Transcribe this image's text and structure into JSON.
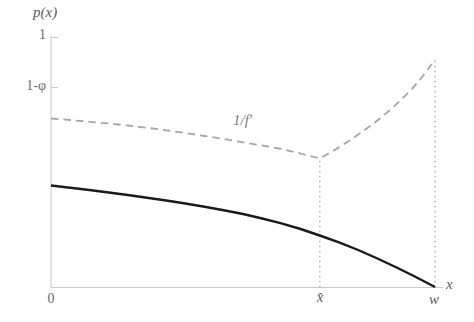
{
  "chart_data": {
    "type": "line",
    "title": "",
    "xlabel": "x",
    "ylabel": "p(x)",
    "ylim": [
      0,
      1
    ],
    "x_domain_note": "x runs from 0 to w; x-hat is approximately 0.70·w",
    "grid": false,
    "axis_color": "#c9c9c9",
    "guide_color": "#b3b3b3",
    "x_ticks": [
      {
        "pos": 0.0,
        "label": "0"
      },
      {
        "pos": 0.7,
        "label": "x̂"
      },
      {
        "pos": 1.0,
        "label": "w"
      }
    ],
    "y_ticks": [
      {
        "pos": 1.0,
        "label": "1"
      },
      {
        "pos": 0.8,
        "label": "1-φ"
      }
    ],
    "series": [
      {
        "name": "1/f′",
        "style": "dashed",
        "color": "#a6a6a6",
        "width": 1.8,
        "dash": "7.5 5",
        "points": [
          [
            0.0,
            0.676
          ],
          [
            0.05,
            0.67
          ],
          [
            0.1,
            0.663
          ],
          [
            0.15,
            0.656
          ],
          [
            0.2,
            0.648
          ],
          [
            0.25,
            0.639
          ],
          [
            0.3,
            0.629
          ],
          [
            0.35,
            0.618
          ],
          [
            0.4,
            0.606
          ],
          [
            0.45,
            0.594
          ],
          [
            0.5,
            0.581
          ],
          [
            0.55,
            0.568
          ],
          [
            0.6,
            0.554
          ],
          [
            0.65,
            0.536
          ],
          [
            0.7,
            0.516
          ],
          [
            0.73,
            0.542
          ],
          [
            0.76,
            0.57
          ],
          [
            0.79,
            0.601
          ],
          [
            0.82,
            0.634
          ],
          [
            0.85,
            0.668
          ],
          [
            0.88,
            0.706
          ],
          [
            0.91,
            0.748
          ],
          [
            0.94,
            0.795
          ],
          [
            0.96,
            0.83
          ],
          [
            0.98,
            0.869
          ],
          [
            1.0,
            0.912
          ]
        ]
      },
      {
        "name": "p(x)",
        "style": "solid",
        "color": "#1a1a1a",
        "width": 2.4,
        "dash": "",
        "points": [
          [
            0.0,
            0.408
          ],
          [
            0.05,
            0.399
          ],
          [
            0.1,
            0.39
          ],
          [
            0.15,
            0.38
          ],
          [
            0.2,
            0.37
          ],
          [
            0.25,
            0.359
          ],
          [
            0.3,
            0.348
          ],
          [
            0.35,
            0.336
          ],
          [
            0.4,
            0.323
          ],
          [
            0.45,
            0.309
          ],
          [
            0.5,
            0.294
          ],
          [
            0.55,
            0.276
          ],
          [
            0.6,
            0.257
          ],
          [
            0.65,
            0.234
          ],
          [
            0.7,
            0.208
          ],
          [
            0.75,
            0.181
          ],
          [
            0.8,
            0.15
          ],
          [
            0.85,
            0.116
          ],
          [
            0.9,
            0.08
          ],
          [
            0.95,
            0.042
          ],
          [
            1.0,
            0.002
          ]
        ]
      }
    ],
    "guides": [
      {
        "x": 0.7,
        "from": 0,
        "to": 0.516
      },
      {
        "x": 1.0,
        "from": 0,
        "to": 0.912
      }
    ],
    "annotations": [
      {
        "text": "1/f′",
        "position": "above dashed curve, mid-plot"
      }
    ]
  }
}
